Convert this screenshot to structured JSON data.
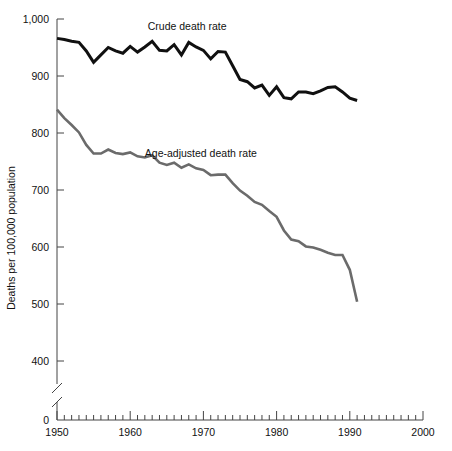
{
  "chart_data": {
    "type": "line",
    "title": "",
    "xlabel": "",
    "ylabel": "Deaths per 100,000 population",
    "xlim": [
      1950,
      2000
    ],
    "ylim": [
      380,
      1000
    ],
    "ylim_display": [
      0,
      1000
    ],
    "axis_break": true,
    "axis_break_note": "y-axis broken between 0 and ~380",
    "grid": false,
    "legend_position": "inline-annotation",
    "x_major_ticks": [
      1950,
      1960,
      1970,
      1980,
      1990,
      2000
    ],
    "x_major_tick_labels": [
      "1950",
      "1960",
      "1970",
      "1980",
      "1990",
      "2000"
    ],
    "x_minor_tick_interval": 1,
    "y_ticks": [
      0,
      400,
      500,
      600,
      700,
      800,
      900,
      1000
    ],
    "y_tick_labels": [
      "0",
      "400",
      "500",
      "600",
      "700",
      "800",
      "900",
      "1,000"
    ],
    "x": [
      1950,
      1951,
      1952,
      1953,
      1954,
      1955,
      1956,
      1957,
      1958,
      1959,
      1960,
      1961,
      1962,
      1963,
      1964,
      1965,
      1966,
      1967,
      1968,
      1969,
      1970,
      1971,
      1972,
      1973,
      1974,
      1975,
      1976,
      1977,
      1978,
      1979,
      1980,
      1981,
      1982,
      1983,
      1984,
      1985,
      1986,
      1987,
      1988,
      1989,
      1990,
      1991
    ],
    "series": [
      {
        "name": "Crude death rate",
        "color": "#101010",
        "line_width": 3.0,
        "label_position": {
          "x": 1962.4,
          "y": 1000
        },
        "values": [
          966,
          964,
          961,
          959,
          944,
          924,
          937,
          950,
          944,
          940,
          952,
          942,
          951,
          961,
          945,
          944,
          955,
          937,
          959,
          951,
          945,
          930,
          943,
          942,
          918,
          894,
          890,
          879,
          884,
          866,
          881,
          862,
          860,
          872,
          872,
          869,
          874,
          880,
          881,
          872,
          861,
          857
        ]
      },
      {
        "name": "Age-adjusted death rate",
        "color": "#6b6b6b",
        "line_width": 2.6,
        "label_position": {
          "x": 1962.0,
          "y": 778
        },
        "values": [
          841,
          826,
          814,
          801,
          779,
          764,
          764,
          771,
          765,
          763,
          766,
          759,
          757,
          761,
          748,
          744,
          748,
          739,
          745,
          738,
          735,
          726,
          727,
          727,
          712,
          699,
          690,
          679,
          674,
          663,
          653,
          629,
          613,
          610,
          601,
          599,
          595,
          590,
          586,
          586,
          560,
          504
        ]
      }
    ]
  },
  "annotations": {
    "crude_label": "Crude death rate",
    "age_adjusted_label": "Age-adjusted death rate"
  }
}
